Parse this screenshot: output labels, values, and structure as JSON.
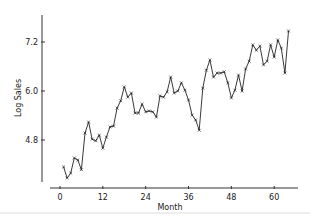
{
  "chart_data": {
    "type": "line",
    "title": "",
    "xlabel": "Month",
    "ylabel": "Log Sales",
    "xlim": [
      -3,
      67
    ],
    "ylim": [
      3.5,
      7.9
    ],
    "xticks": [
      0,
      12,
      24,
      36,
      48,
      60
    ],
    "yticks": [
      4.8,
      6.0,
      7.2
    ],
    "ytick_labels": [
      "4.8",
      "6.0",
      "7.2"
    ],
    "xtick_labels": [
      "0",
      "12",
      "24",
      "36",
      "48",
      "60"
    ],
    "grid": false,
    "legend": null,
    "marker": "x",
    "series": [
      {
        "name": "Log Sales",
        "x": [
          1,
          2,
          3,
          4,
          5,
          6,
          7,
          8,
          9,
          10,
          11,
          12,
          13,
          14,
          15,
          16,
          17,
          18,
          19,
          20,
          21,
          22,
          23,
          24,
          25,
          26,
          27,
          28,
          29,
          30,
          31,
          32,
          33,
          34,
          35,
          36,
          37,
          38,
          39,
          40,
          41,
          42,
          43,
          44,
          45,
          46,
          47,
          48,
          49,
          50,
          51,
          52,
          53,
          54,
          55,
          56,
          57,
          58,
          59,
          60,
          61,
          62,
          63,
          64
        ],
        "values": [
          4.14,
          3.87,
          3.99,
          4.36,
          4.31,
          4.07,
          4.97,
          5.24,
          4.82,
          4.78,
          4.92,
          4.6,
          4.87,
          5.12,
          5.14,
          5.58,
          5.76,
          6.1,
          5.85,
          5.95,
          5.46,
          5.46,
          5.68,
          5.49,
          5.51,
          5.49,
          5.36,
          5.88,
          5.85,
          5.98,
          6.34,
          5.95,
          6.0,
          6.2,
          6.02,
          5.78,
          5.41,
          5.29,
          5.04,
          6.07,
          6.51,
          6.76,
          6.34,
          6.44,
          6.44,
          6.47,
          6.2,
          5.83,
          6.02,
          6.39,
          6.0,
          6.54,
          6.73,
          7.13,
          7.0,
          7.1,
          6.64,
          6.73,
          7.13,
          6.83,
          7.25,
          7.05,
          6.44,
          7.47
        ]
      }
    ]
  },
  "layout": {
    "x0_px": 60,
    "px_per_month": 3.57,
    "y_ref_val": 7.2,
    "y_ref_px": 42,
    "px_per_unit": 40.83,
    "yaxis_x": 42,
    "yaxis_top": 15,
    "yaxis_bottom": 182,
    "xaxis_y": 188,
    "xaxis_left": 50,
    "xaxis_right": 298
  }
}
